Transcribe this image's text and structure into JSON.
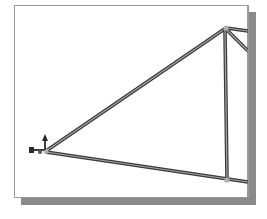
{
  "diagram": {
    "type": "3d-truss-wireframe",
    "colors": {
      "member_dark": "#3a3a3a",
      "member_light": "#a0a0a0",
      "joint": "#b0b0b0",
      "frame_border": "#9a9a9a",
      "shadow": "#8a8a8a",
      "background": "#ffffff"
    },
    "joints": [
      {
        "id": "A",
        "x": 45,
        "y": 151
      },
      {
        "id": "B",
        "x": 226,
        "y": 28
      },
      {
        "id": "C",
        "x": 227,
        "y": 180
      }
    ],
    "members": [
      {
        "from": "A",
        "to": "B"
      },
      {
        "from": "A",
        "to": "C"
      },
      {
        "from": "B",
        "to": "C"
      }
    ],
    "triad_icon": "coordinate-axes-icon"
  }
}
